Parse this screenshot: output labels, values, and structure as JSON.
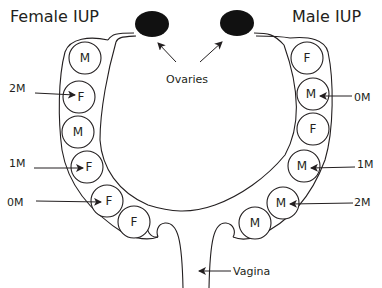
{
  "titles": {
    "left": "Female IUP",
    "right": "Male IUP"
  },
  "labels": {
    "ovaries": "Ovaries",
    "vagina": "Vagina"
  },
  "left_horn": {
    "fetuses": [
      {
        "sex": "M",
        "cx": 85,
        "cy": 58
      },
      {
        "sex": "F",
        "cx": 79,
        "cy": 97,
        "annotation": "2M"
      },
      {
        "sex": "M",
        "cx": 78,
        "cy": 132
      },
      {
        "sex": "F",
        "cx": 87,
        "cy": 167,
        "annotation": "1M"
      },
      {
        "sex": "F",
        "cx": 107,
        "cy": 201,
        "annotation": "0M"
      },
      {
        "sex": "F",
        "cx": 134,
        "cy": 222
      }
    ]
  },
  "right_horn": {
    "fetuses": [
      {
        "sex": "F",
        "cx": 307,
        "cy": 58
      },
      {
        "sex": "M",
        "cx": 313,
        "cy": 94,
        "annotation": "0M"
      },
      {
        "sex": "F",
        "cx": 313,
        "cy": 129
      },
      {
        "sex": "M",
        "cx": 304,
        "cy": 166,
        "annotation": "1M"
      },
      {
        "sex": "M",
        "cx": 283,
        "cy": 203,
        "annotation": "2M"
      },
      {
        "sex": "M",
        "cx": 255,
        "cy": 223
      }
    ]
  },
  "annotations": {
    "left": [
      "2M",
      "1M",
      "0M"
    ],
    "right": [
      "0M",
      "1M",
      "2M"
    ]
  },
  "colors": {
    "line": "#231f20",
    "ovary_fill": "#111111",
    "background": "#ffffff"
  }
}
